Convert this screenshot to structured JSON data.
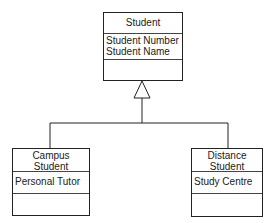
{
  "diagram": {
    "type": "uml-class-diagram",
    "relationship": "generalization",
    "classes": [
      {
        "id": "student",
        "name_lines": [
          "Student"
        ],
        "attributes": [
          "Student Number",
          "Student Name"
        ],
        "operations": []
      },
      {
        "id": "campus-student",
        "name_lines": [
          "Campus",
          "Student"
        ],
        "attributes": [
          "Personal Tutor"
        ],
        "operations": []
      },
      {
        "id": "distance-student",
        "name_lines": [
          "Distance",
          "Student"
        ],
        "attributes": [
          "Study Centre"
        ],
        "operations": []
      }
    ],
    "generalizations": [
      {
        "child": "campus-student",
        "parent": "student"
      },
      {
        "child": "distance-student",
        "parent": "student"
      }
    ],
    "colors": {
      "line": "#222222",
      "background": "#ffffff",
      "text": "#1a1a1a"
    }
  }
}
